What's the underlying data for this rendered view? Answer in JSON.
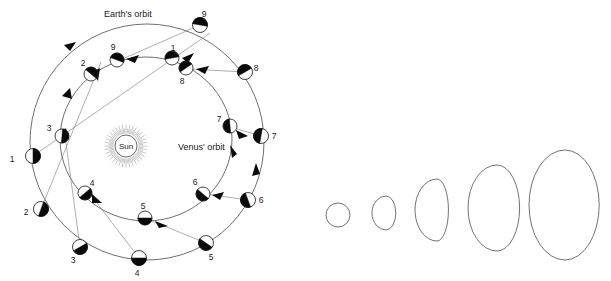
{
  "figure": {
    "background_color": "#ffffff",
    "line_color": "#4a4a4a",
    "sight_line_color": "#8d8d8d",
    "dark_side_color": "#0a0a0a",
    "lit_side_color": "#ffffff"
  },
  "labels": {
    "earth_orbit": "Earth's orbit",
    "venus_orbit": "Venus' orbit",
    "sun": "Sun",
    "watermark": ""
  },
  "earth_positions": [
    {
      "id": "1",
      "label": "1",
      "cx": 33,
      "cy": 156,
      "label_x": 12,
      "label_y": 162,
      "dark_angle": 180
    },
    {
      "id": "2",
      "label": "2",
      "cx": 41,
      "cy": 209,
      "label_x": 26,
      "label_y": 215,
      "dark_angle": 200
    },
    {
      "id": "3",
      "label": "3",
      "cx": 80,
      "cy": 247,
      "label_x": 73,
      "label_y": 263,
      "dark_angle": 240
    },
    {
      "id": "4",
      "label": "4",
      "cx": 139,
      "cy": 258,
      "label_x": 137,
      "label_y": 276,
      "dark_angle": 270
    },
    {
      "id": "5",
      "label": "5",
      "cx": 206,
      "cy": 243,
      "label_x": 211,
      "label_y": 260,
      "dark_angle": 305
    },
    {
      "id": "6",
      "label": "6",
      "cx": 248,
      "cy": 200,
      "label_x": 261,
      "label_y": 203,
      "dark_angle": 340
    },
    {
      "id": "7",
      "label": "7",
      "cx": 261,
      "cy": 136,
      "label_x": 274,
      "label_y": 139,
      "dark_angle": 10
    },
    {
      "id": "8",
      "label": "8",
      "cx": 245,
      "cy": 72,
      "label_x": 256,
      "label_y": 71,
      "dark_angle": 60
    },
    {
      "id": "9",
      "label": "9",
      "cx": 200,
      "cy": 25,
      "label_x": 204,
      "label_y": 17,
      "dark_angle": 100
    }
  ],
  "venus_positions": [
    {
      "id": "1",
      "label": "1",
      "cx": 172,
      "cy": 58,
      "label_x": 173,
      "label_y": 51,
      "dark_angle": 80
    },
    {
      "id": "2",
      "label": "2",
      "cx": 91,
      "cy": 74,
      "label_x": 83,
      "label_y": 66,
      "dark_angle": 130
    },
    {
      "id": "3",
      "label": "3",
      "cx": 62,
      "cy": 136,
      "label_x": 49,
      "label_y": 131,
      "dark_angle": 185
    },
    {
      "id": "4",
      "label": "4",
      "cx": 85,
      "cy": 193,
      "label_x": 92,
      "label_y": 186,
      "dark_angle": 230
    },
    {
      "id": "5",
      "label": "5",
      "cx": 145,
      "cy": 218,
      "label_x": 143,
      "label_y": 209,
      "dark_angle": 270
    },
    {
      "id": "6",
      "label": "6",
      "cx": 203,
      "cy": 194,
      "label_x": 195,
      "label_y": 185,
      "dark_angle": 310
    },
    {
      "id": "7",
      "label": "7",
      "cx": 230,
      "cy": 126,
      "label_x": 219,
      "label_y": 122,
      "dark_angle": 355
    },
    {
      "id": "8",
      "label": "8",
      "cx": 186,
      "cy": 68,
      "label_x": 182,
      "label_y": 84,
      "dark_angle": 55
    },
    {
      "id": "9",
      "label": "9",
      "cx": 117,
      "cy": 60,
      "label_x": 113,
      "label_y": 50,
      "dark_angle": 110
    }
  ],
  "telescope_views": [
    {
      "id": "view-1",
      "phase": "full-small-disk",
      "cx": 338,
      "cy": 215,
      "rx": 12,
      "ry": 12
    },
    {
      "id": "view-2",
      "phase": "gibbous",
      "cx": 386,
      "cy": 213,
      "rx": 14,
      "ry": 17
    },
    {
      "id": "view-3",
      "phase": "crescent-thick",
      "cx": 437,
      "cy": 210,
      "rx": 22,
      "ry": 31
    },
    {
      "id": "view-4",
      "phase": "crescent-wide",
      "cx": 497,
      "cy": 208,
      "rx": 29,
      "ry": 43
    },
    {
      "id": "view-5",
      "phase": "crescent-thin",
      "cx": 565,
      "cy": 205,
      "rx": 36,
      "ry": 55
    }
  ],
  "sun": {
    "cx": 126,
    "cy": 146,
    "r": 11,
    "ray_count": 72
  }
}
